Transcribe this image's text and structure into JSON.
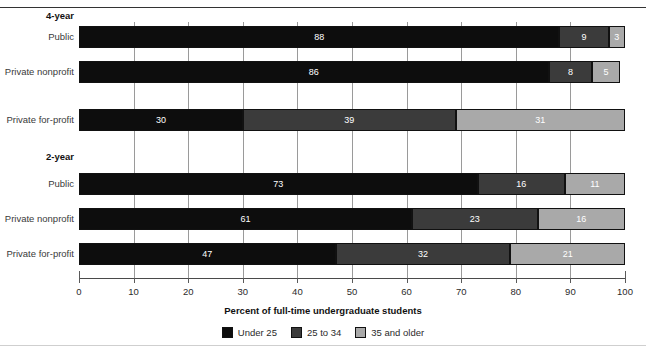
{
  "chart_data": {
    "type": "bar",
    "orientation": "horizontal",
    "stacked": true,
    "title": "",
    "xlabel": "Percent of full-time undergraduate students",
    "ylabel": "",
    "xlim": [
      0,
      100
    ],
    "xticks": [
      0,
      10,
      20,
      30,
      40,
      50,
      60,
      70,
      80,
      90,
      100
    ],
    "grid": true,
    "grid_axis": "x",
    "legend_position": "bottom-center",
    "legend": [
      "Under 25",
      "25 to 34",
      "35 and older"
    ],
    "series": [
      {
        "name": "Under 25",
        "color": "#0d0d0d",
        "values": [
          88,
          86,
          30,
          73,
          61,
          47
        ]
      },
      {
        "name": "25 to 34",
        "color": "#3b3b3b",
        "values": [
          9,
          8,
          39,
          16,
          23,
          32
        ]
      },
      {
        "name": "35 and older",
        "color": "#a9a9a9",
        "values": [
          3,
          5,
          31,
          11,
          16,
          21
        ]
      }
    ],
    "groups": [
      {
        "label": "4-year",
        "categories": [
          "Public",
          "Private nonprofit",
          "Private for-profit"
        ]
      },
      {
        "label": "2-year",
        "categories": [
          "Public",
          "Private nonprofit",
          "Private for-profit"
        ]
      }
    ],
    "categories": [
      "Public",
      "Private nonprofit",
      "Private for-profit",
      "Public",
      "Private nonprofit",
      "Private for-profit"
    ],
    "rows": [
      {
        "group": "4-year",
        "category": "Public",
        "under_25": 88,
        "age_25_34": 9,
        "age_35_plus": 3
      },
      {
        "group": "4-year",
        "category": "Private nonprofit",
        "under_25": 86,
        "age_25_34": 8,
        "age_35_plus": 5
      },
      {
        "group": "4-year",
        "category": "Private for-profit",
        "under_25": 30,
        "age_25_34": 39,
        "age_35_plus": 31
      },
      {
        "group": "2-year",
        "category": "Public",
        "under_25": 73,
        "age_25_34": 16,
        "age_35_plus": 11
      },
      {
        "group": "2-year",
        "category": "Private nonprofit",
        "under_25": 61,
        "age_25_34": 23,
        "age_35_plus": 16
      },
      {
        "group": "2-year",
        "category": "Private for-profit",
        "under_25": 47,
        "age_25_34": 32,
        "age_35_plus": 21
      }
    ]
  },
  "colors": {
    "under_25": "#0d0d0d",
    "age_25_34": "#3b3b3b",
    "age_35_plus": "#a9a9a9",
    "axis": "#4a4a4a",
    "grid": "#9a9a9a",
    "text": "#2b2b2b"
  }
}
